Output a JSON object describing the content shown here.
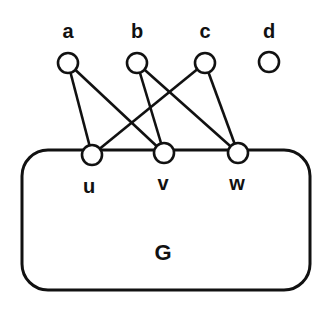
{
  "diagram": {
    "graph_label": "G",
    "box": {
      "x": 22,
      "y": 150,
      "w": 288,
      "h": 140,
      "r": 26
    },
    "nodes": [
      {
        "id": "a",
        "label": "a",
        "x": 68,
        "y": 63,
        "lx": 68,
        "ly": 38
      },
      {
        "id": "b",
        "label": "b",
        "x": 137,
        "y": 63,
        "lx": 137,
        "ly": 38
      },
      {
        "id": "c",
        "label": "c",
        "x": 205,
        "y": 63,
        "lx": 205,
        "ly": 38
      },
      {
        "id": "d",
        "label": "d",
        "x": 269,
        "y": 62,
        "lx": 269,
        "ly": 38
      },
      {
        "id": "u",
        "label": "u",
        "x": 92,
        "y": 155,
        "lx": 89,
        "ly": 193
      },
      {
        "id": "v",
        "label": "v",
        "x": 164,
        "y": 153,
        "lx": 163,
        "ly": 190
      },
      {
        "id": "w",
        "label": "w",
        "x": 238,
        "y": 153,
        "lx": 237,
        "ly": 190
      }
    ],
    "edges": [
      [
        "a",
        "u"
      ],
      [
        "a",
        "v"
      ],
      [
        "b",
        "v"
      ],
      [
        "b",
        "w"
      ],
      [
        "c",
        "u"
      ],
      [
        "c",
        "w"
      ]
    ],
    "colors": {
      "stroke": "#111111",
      "fill": "#ffffff"
    }
  }
}
